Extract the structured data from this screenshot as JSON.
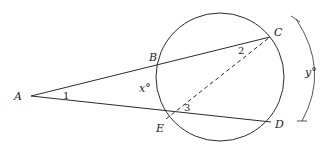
{
  "diagram": {
    "type": "geometry-circle-secants",
    "colors": {
      "stroke": "#2b2b2b",
      "text": "#222222",
      "background": "#ffffff"
    },
    "circle": {
      "cx": 220,
      "cy": 77,
      "r": 64
    },
    "points": {
      "A": {
        "label": "A",
        "x": 31,
        "y": 96
      },
      "B": {
        "label": "B",
        "x": 159,
        "y": 64
      },
      "C": {
        "label": "C",
        "x": 270,
        "y": 37
      },
      "E": {
        "label": "E",
        "x": 166,
        "y": 119
      },
      "D": {
        "label": "D",
        "x": 271,
        "y": 122
      }
    },
    "segments": [
      {
        "from": "A",
        "to": "C",
        "style": "solid"
      },
      {
        "from": "A",
        "to": "D",
        "style": "solid"
      },
      {
        "from": "E",
        "to": "C",
        "style": "dashed"
      }
    ],
    "angle_labels": {
      "angle1": "1",
      "angle2": "2",
      "angle3": "3"
    },
    "arc_labels": {
      "x": "x°",
      "y": "y°"
    }
  }
}
